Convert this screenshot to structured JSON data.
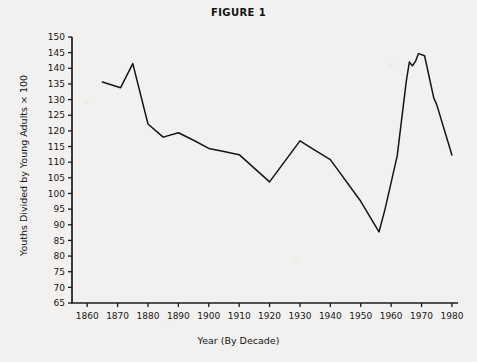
{
  "chart_data": {
    "type": "line",
    "title": "FIGURE 1",
    "xlabel": "Year (By Decade)",
    "ylabel": "Youths Divided by Young Adults × 100",
    "xlim": [
      1855,
      1982
    ],
    "ylim": [
      65,
      150
    ],
    "grid": false,
    "legend": "none",
    "line_color": "#141414",
    "background_color": "#f3f1ef",
    "x_ticks": [
      1860,
      1870,
      1880,
      1890,
      1900,
      1910,
      1920,
      1930,
      1940,
      1950,
      1960,
      1970,
      1980
    ],
    "x_tick_labels": [
      "1860",
      "1870",
      "1880",
      "1890",
      "1900",
      "1910",
      "1920",
      "1930",
      "1940",
      "1950",
      "1960",
      "1970",
      "1980"
    ],
    "y_ticks": [
      65,
      70,
      75,
      80,
      85,
      90,
      95,
      100,
      105,
      110,
      115,
      120,
      125,
      130,
      135,
      140,
      145,
      150
    ],
    "y_tick_labels": [
      "65",
      "70",
      "75",
      "80",
      "85",
      "90",
      "95",
      "100",
      "105",
      "110",
      "115",
      "120",
      "125",
      "130",
      "135",
      "140",
      "145",
      "150"
    ],
    "series": [
      {
        "name": "Youth-to-young-adult ratio",
        "x": [
          1865,
          1871,
          1875,
          1880,
          1885,
          1890,
          1895,
          1900,
          1905,
          1910,
          1920,
          1930,
          1935,
          1940,
          1950,
          1956,
          1958,
          1962,
          1965,
          1966,
          1967,
          1968,
          1969,
          1971,
          1974,
          1975,
          1980
        ],
        "values": [
          135.6,
          133.8,
          141.5,
          122.2,
          118.0,
          119.4,
          117.0,
          114.4,
          113.4,
          112.4,
          103.7,
          116.8,
          113.8,
          110.8,
          97.5,
          87.7,
          95.0,
          112.0,
          136.0,
          142.0,
          140.8,
          142.2,
          144.7,
          144.0,
          130.6,
          128.4,
          112.3
        ]
      }
    ]
  },
  "figure": {
    "title": "FIGURE 1",
    "x_axis_title": "Year (By Decade)",
    "y_axis_title": "Youths Divided by Young Adults × 100"
  }
}
